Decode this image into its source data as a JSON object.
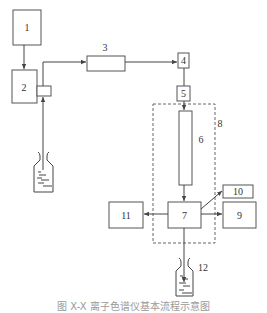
{
  "figure": {
    "type": "flow-diagram",
    "caption": "图 X-X 离子色谱仪基本流程示意图",
    "components": [
      {
        "id": "1",
        "label": "1"
      },
      {
        "id": "2",
        "label": "2"
      },
      {
        "id": "3",
        "label": "3"
      },
      {
        "id": "4",
        "label": "4"
      },
      {
        "id": "5",
        "label": "5"
      },
      {
        "id": "6",
        "label": "6"
      },
      {
        "id": "7",
        "label": "7"
      },
      {
        "id": "8",
        "label": "8"
      },
      {
        "id": "9",
        "label": "9"
      },
      {
        "id": "10",
        "label": "10"
      },
      {
        "id": "11",
        "label": "11"
      },
      {
        "id": "12",
        "label": "12"
      }
    ],
    "connections": [
      {
        "from": "1",
        "to": "2"
      },
      {
        "from": "reservoir",
        "to": "2"
      },
      {
        "from": "2",
        "to": "3"
      },
      {
        "from": "3",
        "to": "4"
      },
      {
        "from": "4",
        "to": "5"
      },
      {
        "from": "5",
        "to": "6"
      },
      {
        "from": "6",
        "to": "7"
      },
      {
        "from": "7",
        "to": "11"
      },
      {
        "from": "7",
        "to": "9"
      },
      {
        "from": "7",
        "to": "10"
      },
      {
        "from": "7",
        "to": "12"
      }
    ],
    "colors": {
      "stroke": "#555555",
      "text": "#333333",
      "caption": "#9a9a9a"
    }
  }
}
